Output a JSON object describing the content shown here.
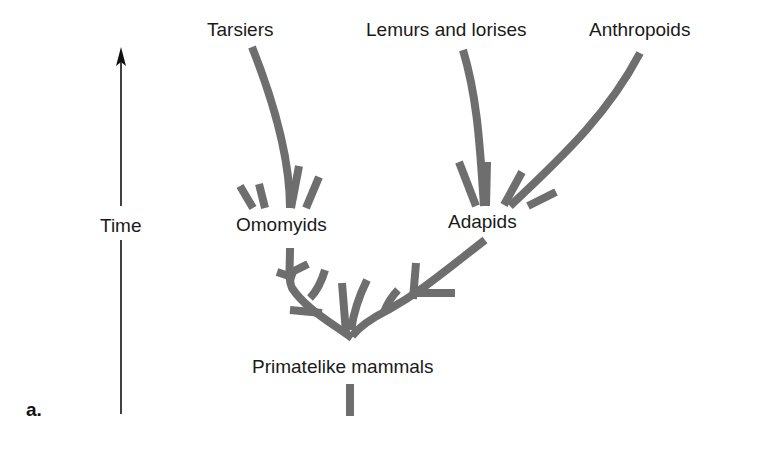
{
  "figure": {
    "panel_label": "a.",
    "axis": {
      "label": "Time",
      "direction": "up"
    },
    "taxa": {
      "tarsiers": "Tarsiers",
      "lemurs": "Lemurs and lorises",
      "anthropoids": "Anthropoids",
      "omomyids": "Omomyids",
      "adapids": "Adapids",
      "root": "Primatelike mammals"
    },
    "colors": {
      "branch": "#6e6e6e",
      "text": "#1a1a1a",
      "background": "#ffffff"
    }
  }
}
